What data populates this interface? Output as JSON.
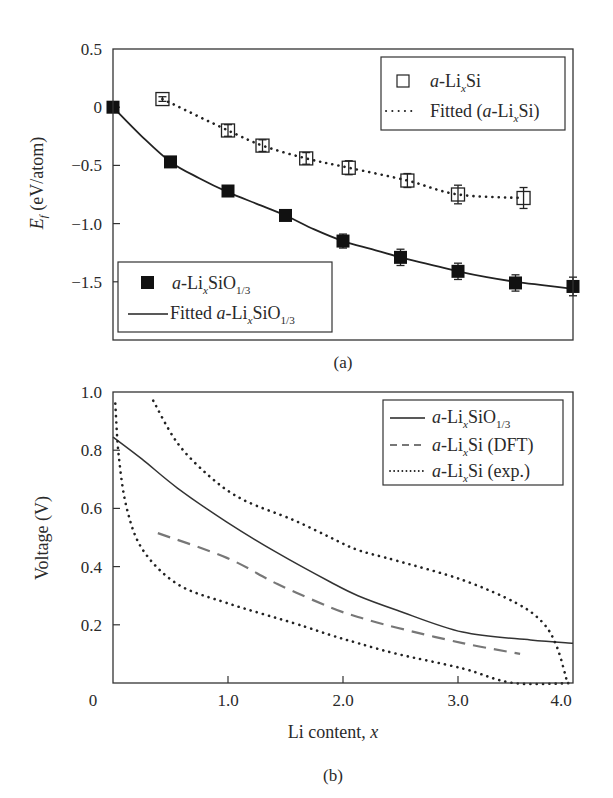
{
  "figure": {
    "panel_a_label": "(a)",
    "panel_b_label": "(b)"
  },
  "chart_data": [
    {
      "id": "a",
      "type": "scatter",
      "title": "",
      "panel_label": "(a)",
      "xlabel": "",
      "ylabel": "E_f (eV/atom)",
      "ylabel_parts": {
        "main": "E",
        "sub": "f",
        "rest": " (eV/atom)"
      },
      "xlim": [
        0,
        4.0
      ],
      "ylim": [
        -2.0,
        0.5
      ],
      "yticks": [
        0.5,
        0,
        -0.5,
        -1.0,
        -1.5
      ],
      "ytick_labels": [
        "0.5",
        "0",
        "−0.5",
        "−1.0",
        "−1.5"
      ],
      "xticks": [],
      "grid": false,
      "series": [
        {
          "name": "a-LixSi",
          "marker": "open-square",
          "x": [
            0.43,
            1.0,
            1.3,
            1.68,
            2.05,
            2.56,
            3.0,
            3.57
          ],
          "y": [
            0.07,
            -0.2,
            -0.33,
            -0.44,
            -0.52,
            -0.63,
            -0.75,
            -0.78
          ],
          "yerr": [
            0.02,
            0.05,
            0.05,
            0.05,
            0.06,
            0.06,
            0.08,
            0.09
          ]
        },
        {
          "name": "Fitted (a-LixSi)",
          "line": "dotted",
          "x": [
            0.43,
            1.0,
            1.3,
            1.68,
            2.05,
            2.56,
            3.0,
            3.57
          ],
          "y": [
            0.07,
            -0.2,
            -0.33,
            -0.44,
            -0.52,
            -0.63,
            -0.75,
            -0.78
          ]
        },
        {
          "name": "a-LixSiO1/3",
          "marker": "filled-square",
          "x": [
            0,
            0.5,
            1.0,
            1.5,
            2.0,
            2.5,
            3.0,
            3.5,
            4.0
          ],
          "y": [
            0,
            -0.47,
            -0.72,
            -0.93,
            -1.15,
            -1.29,
            -1.41,
            -1.51,
            -1.54
          ],
          "yerr": [
            0.0,
            0.0,
            0.0,
            0.0,
            0.06,
            0.07,
            0.07,
            0.07,
            0.08
          ]
        },
        {
          "name": "Fitted a-LixSiO1/3",
          "line": "solid",
          "x": [
            0,
            0.25,
            0.5,
            0.75,
            1.0,
            1.25,
            1.5,
            1.75,
            2.0,
            2.25,
            2.5,
            2.75,
            3.0,
            3.25,
            3.5,
            3.75,
            4.0
          ],
          "y": [
            0,
            -0.25,
            -0.47,
            -0.61,
            -0.73,
            -0.83,
            -0.93,
            -1.05,
            -1.15,
            -1.22,
            -1.29,
            -1.35,
            -1.41,
            -1.46,
            -1.5,
            -1.53,
            -1.56
          ]
        }
      ],
      "legends": [
        {
          "position": "upper right",
          "entries": [
            {
              "symbol": "open-square",
              "prefix": "a",
              "text1": "-Li",
              "sub1": "x",
              "text2": "Si",
              "sub2": "",
              "text3": ""
            },
            {
              "symbol": "dotted-line",
              "prefix": "",
              "pre": "Fitted (",
              "italic": "a",
              "text1": "-Li",
              "sub1": "x",
              "text2": "Si)",
              "sub2": "",
              "text3": ""
            }
          ]
        },
        {
          "position": "lower left",
          "entries": [
            {
              "symbol": "filled-square",
              "prefix": "a",
              "text1": "-Li",
              "sub1": "x",
              "text2": "SiO",
              "sub2": "1/3",
              "text3": ""
            },
            {
              "symbol": "solid-line",
              "pre": "Fitted ",
              "italic": "a",
              "text1": "-Li",
              "sub1": "x",
              "text2": "SiO",
              "sub2": "1/3",
              "text3": ""
            }
          ]
        }
      ]
    },
    {
      "id": "b",
      "type": "line",
      "title": "",
      "panel_label": "(b)",
      "xlabel": "Li content, x",
      "xlabel_parts": {
        "main": "Li content, ",
        "italic": "x"
      },
      "ylabel": "Voltage (V)",
      "xlim": [
        0,
        4.0
      ],
      "ylim": [
        0,
        1.0
      ],
      "xticks": [
        0,
        1.0,
        2.0,
        3.0,
        4.0
      ],
      "xtick_labels": [
        "0",
        "1.0",
        "2.0",
        "3.0",
        "4.0"
      ],
      "yticks": [
        1.0,
        0.8,
        0.6,
        0.4,
        0.2
      ],
      "ytick_labels": [
        "1.0",
        "0.8",
        "0.6",
        "0.4",
        "0.2"
      ],
      "grid": false,
      "series": [
        {
          "name": "a-LixSiO1/3",
          "line": "solid",
          "color": "#333333",
          "x": [
            0,
            0.25,
            0.56,
            0.99,
            1.43,
            1.89,
            2.13,
            2.47,
            3.04,
            3.63,
            4.0
          ],
          "y": [
            0.845,
            0.77,
            0.67,
            0.553,
            0.447,
            0.347,
            0.3,
            0.25,
            0.175,
            0.148,
            0.137
          ]
        },
        {
          "name": "a-LixSi (DFT)",
          "line": "dashed",
          "color": "#777777",
          "x": [
            0.39,
            0.99,
            1.43,
            1.89,
            2.13,
            2.47,
            3.04,
            3.54
          ],
          "y": [
            0.515,
            0.43,
            0.34,
            0.26,
            0.227,
            0.19,
            0.137,
            0.1
          ]
        },
        {
          "name": "a-LixSi (exp.) discharge",
          "line": "dotted",
          "color": "#222222",
          "x": [
            0.02,
            0.05,
            0.12,
            0.26,
            0.56,
            0.99,
            1.57,
            1.89,
            2.13,
            2.47,
            3.04,
            3.48,
            4.0
          ],
          "y": [
            0.96,
            0.78,
            0.6,
            0.457,
            0.34,
            0.275,
            0.206,
            0.165,
            0.137,
            0.1,
            0.05,
            0.0,
            0.0
          ]
        },
        {
          "name": "a-LixSi (exp.) charge",
          "line": "dotted",
          "color": "#222222",
          "x": [
            0.35,
            0.56,
            0.84,
            1.13,
            1.57,
            1.89,
            2.13,
            2.47,
            3.04,
            3.51,
            3.74,
            3.86,
            3.95
          ],
          "y": [
            0.97,
            0.825,
            0.71,
            0.63,
            0.56,
            0.5,
            0.457,
            0.42,
            0.354,
            0.274,
            0.206,
            0.124,
            0.003
          ]
        }
      ],
      "legends": [
        {
          "position": "upper right",
          "entries": [
            {
              "symbol": "solid-line",
              "italic": "a",
              "text1": "-Li",
              "sub1": "x",
              "text2": "SiO",
              "sub2": "1/3",
              "text3": ""
            },
            {
              "symbol": "dashed-line",
              "italic": "a",
              "text1": "-Li",
              "sub1": "x",
              "text2": "Si (DFT)",
              "sub2": "",
              "text3": ""
            },
            {
              "symbol": "dotted-line",
              "italic": "a",
              "text1": "-Li",
              "sub1": "x",
              "text2": "Si (exp.)",
              "sub2": "",
              "text3": ""
            }
          ]
        }
      ]
    }
  ]
}
